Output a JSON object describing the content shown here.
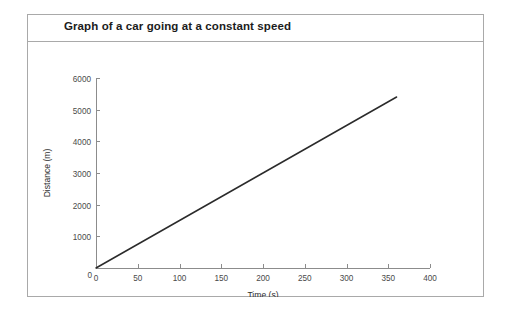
{
  "card": {
    "title": "Graph of a car going at a constant speed",
    "border_color": "#a9a9a9",
    "background": "#ffffff"
  },
  "chart_data": {
    "type": "line",
    "title": "Graph of a car going at a constant speed",
    "xlabel": "Time (s)",
    "ylabel": "Distance (m)",
    "xlim": [
      0,
      400
    ],
    "ylim": [
      0,
      6000
    ],
    "xticks": [
      0,
      50,
      100,
      150,
      200,
      250,
      300,
      350,
      400
    ],
    "yticks": [
      0,
      1000,
      2000,
      3000,
      4000,
      5000,
      6000
    ],
    "xtick_labels": [
      "0",
      "50",
      "100",
      "150",
      "200",
      "250",
      "300",
      "350",
      "400"
    ],
    "ytick_labels": [
      "0",
      "1000",
      "2000",
      "3000",
      "4000",
      "5000",
      "6000"
    ],
    "grid": false,
    "legend": false,
    "line_color": "#2b2b2b",
    "series": [
      {
        "name": "Distance travelled",
        "x": [
          0,
          360
        ],
        "y": [
          0,
          5400
        ],
        "points": [
          {
            "x": 0,
            "y": 0
          },
          {
            "x": 50,
            "y": 750
          },
          {
            "x": 100,
            "y": 1500
          },
          {
            "x": 150,
            "y": 2250
          },
          {
            "x": 200,
            "y": 3000
          },
          {
            "x": 250,
            "y": 3750
          },
          {
            "x": 300,
            "y": 4500
          },
          {
            "x": 350,
            "y": 5250
          },
          {
            "x": 360,
            "y": 5400
          }
        ]
      }
    ]
  }
}
